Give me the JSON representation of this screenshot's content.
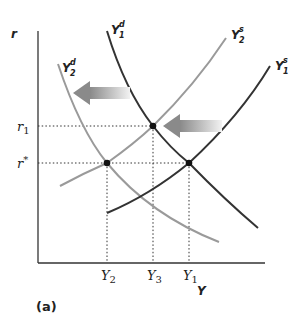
{
  "diagram": {
    "caption": "(a)",
    "axes": {
      "y_label": "r",
      "x_label": "Y"
    },
    "y_ticks": [
      {
        "label_main": "r",
        "label_sub": "1",
        "name": "r1"
      },
      {
        "label_main": "r",
        "label_sup": "*",
        "name": "r-star"
      }
    ],
    "x_ticks": [
      {
        "label_main": "Y",
        "label_sub": "2",
        "name": "Y2"
      },
      {
        "label_main": "Y",
        "label_sub": "3",
        "name": "Y3"
      },
      {
        "label_main": "Y",
        "label_sub": "1",
        "name": "Y1"
      }
    ],
    "curves": [
      {
        "name": "Y1d",
        "main": "Y",
        "sup": "d",
        "sub": "1",
        "color": "#333333",
        "kind": "demand"
      },
      {
        "name": "Y2d",
        "main": "Y",
        "sup": "d",
        "sub": "2",
        "color": "#9a9a9a",
        "kind": "demand"
      },
      {
        "name": "Y1s",
        "main": "Y",
        "sup": "s",
        "sub": "1",
        "color": "#333333",
        "kind": "supply"
      },
      {
        "name": "Y2s",
        "main": "Y",
        "sup": "s",
        "sub": "2",
        "color": "#9a9a9a",
        "kind": "supply"
      }
    ],
    "equilibria": [
      {
        "name": "r-star-Y2",
        "desc": "Y2d meets Y2s at r*"
      },
      {
        "name": "r1-Y3",
        "desc": "Y1d meets Y2s at r1"
      },
      {
        "name": "r-star-Y1",
        "desc": "Y1d meets Y1s at r*"
      }
    ],
    "shift_arrows": [
      {
        "name": "demand-shift-arrow",
        "direction": "left",
        "desc": "Demand shifts from Y1d to Y2d"
      },
      {
        "name": "supply-shift-arrow",
        "direction": "left",
        "desc": "Supply shifts from Y1s to Y2s"
      }
    ],
    "colors": {
      "dark_curve": "#333333",
      "light_curve": "#9a9a9a",
      "axis": "#333333",
      "arrow_dark": "#888888",
      "arrow_light": "#eeeeee"
    }
  }
}
